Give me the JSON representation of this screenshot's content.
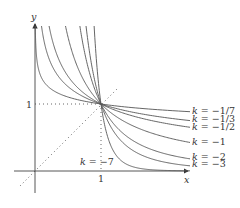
{
  "diagram": {
    "axes": {
      "x_label": "x",
      "y_label": "y",
      "x_tick": "1",
      "y_tick": "1"
    },
    "reference_lines": [
      "y = x (dotted)",
      "x = 1 (dotted)",
      "y = 1 (dotted)"
    ],
    "curves": [
      {
        "k": -7,
        "label": "k = −7"
      },
      {
        "k": -3,
        "label": "k = −3"
      },
      {
        "k": -2,
        "label": "k = −2"
      },
      {
        "k": -1,
        "label": "k = −1"
      },
      {
        "k": -0.5,
        "label": "k = −1/2"
      },
      {
        "k": -0.3333333,
        "label": "k = −1/3"
      },
      {
        "k": -0.1428571,
        "label": "k = −1/7"
      }
    ],
    "right_labels": [
      {
        "text": "k = −1/7",
        "y": 114
      },
      {
        "text": "k = −1/3",
        "y": 122
      },
      {
        "text": "k = −1/2",
        "y": 130
      },
      {
        "text": "k = −1",
        "y": 145
      },
      {
        "text": "k = −2",
        "y": 160
      },
      {
        "text": "k = −3",
        "y": 167
      }
    ],
    "inner_label": {
      "text": "k = −7"
    },
    "colors": {
      "curve": "#555555",
      "axis": "#444444",
      "dotted": "#666666",
      "text": "#333333"
    }
  }
}
